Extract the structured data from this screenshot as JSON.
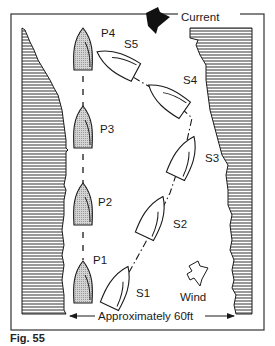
{
  "figure": {
    "caption": "Fig. 55",
    "width_label": "Approximately 60ft",
    "current_label": "Current",
    "wind_label": "Wind",
    "colors": {
      "line": "#1a1a1a",
      "hull_fill": "#c8c8c8",
      "bank_hatch": "#555555",
      "background": "#ffffff"
    }
  },
  "port_boats": [
    {
      "id": "P1",
      "label": "P1"
    },
    {
      "id": "P2",
      "label": "P2"
    },
    {
      "id": "P3",
      "label": "P3"
    },
    {
      "id": "P4",
      "label": "P4"
    }
  ],
  "starboard_boats": [
    {
      "id": "S1",
      "label": "S1"
    },
    {
      "id": "S2",
      "label": "S2"
    },
    {
      "id": "S3",
      "label": "S3"
    },
    {
      "id": "S4",
      "label": "S4"
    },
    {
      "id": "S5",
      "label": "S5"
    }
  ]
}
